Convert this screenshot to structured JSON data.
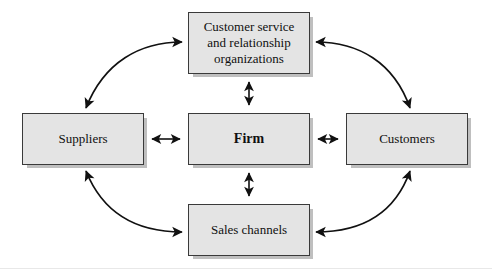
{
  "diagram": {
    "type": "relationship-flow-diagram",
    "canvas": {
      "width": 492,
      "height": 275
    },
    "style": {
      "box_fill": "#e4e4e4",
      "box_border": "#3a3a3a",
      "shadow": "#bfbfbf",
      "arrow": "#111111",
      "background": "#ffffff"
    },
    "nodes": {
      "customer_service": {
        "label": "Customer service\nand relationship\norganizations"
      },
      "suppliers": {
        "label": "Suppliers"
      },
      "firm": {
        "label": "Firm"
      },
      "customers": {
        "label": "Customers"
      },
      "sales_channels": {
        "label": "Sales channels"
      }
    },
    "connectors": [
      {
        "name": "suppliers-firm",
        "kind": "straight",
        "orientation": "horizontal",
        "heads": "both"
      },
      {
        "name": "firm-customers",
        "kind": "straight",
        "orientation": "horizontal",
        "heads": "both"
      },
      {
        "name": "firm-customer-service",
        "kind": "straight",
        "orientation": "vertical",
        "heads": "both"
      },
      {
        "name": "firm-sales-channels",
        "kind": "straight",
        "orientation": "vertical",
        "heads": "both"
      },
      {
        "name": "suppliers-customer-service",
        "kind": "curved",
        "heads": "both"
      },
      {
        "name": "customer-service-customers",
        "kind": "curved",
        "heads": "both"
      },
      {
        "name": "suppliers-sales-channels",
        "kind": "curved",
        "heads": "both"
      },
      {
        "name": "sales-channels-customers",
        "kind": "curved",
        "heads": "both"
      }
    ]
  }
}
